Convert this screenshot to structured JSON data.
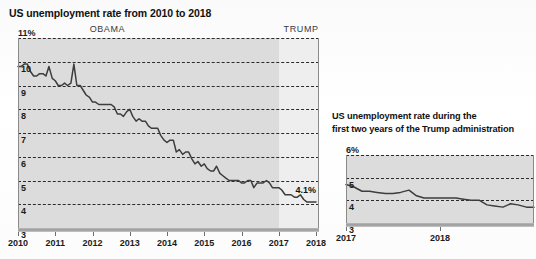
{
  "chart_data": [
    {
      "id": "left",
      "type": "line",
      "title": "US unemployment rate from 2010 to 2018",
      "xlabel": "",
      "ylabel": "",
      "ylim": [
        3,
        11
      ],
      "xlim": [
        2010,
        2018.08
      ],
      "grid": true,
      "y_unit_suffix": "%",
      "ytick_labels": [
        "11%",
        "10",
        "9",
        "8",
        "7",
        "6",
        "5",
        "4",
        "3"
      ],
      "ytick_values": [
        11,
        10,
        9,
        8,
        7,
        6,
        5,
        4,
        3
      ],
      "xtick_labels": [
        "2010",
        "2011",
        "2012",
        "2013",
        "2014",
        "2015",
        "2016",
        "2017",
        "2018"
      ],
      "xtick_values": [
        2010,
        2011,
        2012,
        2013,
        2014,
        2015,
        2016,
        2017,
        2018
      ],
      "era_bands": [
        {
          "label": "OBAMA",
          "start": 2010,
          "end": 2017,
          "shade": "#dcdcdc",
          "label_at": 2012.4
        },
        {
          "label": "TRUMP",
          "start": 2017,
          "end": 2018.08,
          "shade": "#eeeeee",
          "label_at": 2017.6
        }
      ],
      "annotations": [
        {
          "text": "4.1%",
          "x": 2017.45,
          "y": 4.55
        }
      ],
      "x": [
        2010.0,
        2010.08,
        2010.17,
        2010.25,
        2010.33,
        2010.42,
        2010.5,
        2010.58,
        2010.67,
        2010.75,
        2010.83,
        2010.92,
        2011.0,
        2011.08,
        2011.17,
        2011.25,
        2011.33,
        2011.42,
        2011.5,
        2011.58,
        2011.67,
        2011.75,
        2011.83,
        2011.92,
        2012.0,
        2012.08,
        2012.17,
        2012.25,
        2012.33,
        2012.42,
        2012.5,
        2012.58,
        2012.67,
        2012.75,
        2012.83,
        2012.92,
        2013.0,
        2013.08,
        2013.17,
        2013.25,
        2013.33,
        2013.42,
        2013.5,
        2013.58,
        2013.67,
        2013.75,
        2013.83,
        2013.92,
        2014.0,
        2014.08,
        2014.17,
        2014.25,
        2014.33,
        2014.42,
        2014.5,
        2014.58,
        2014.67,
        2014.75,
        2014.83,
        2014.92,
        2015.0,
        2015.08,
        2015.17,
        2015.25,
        2015.33,
        2015.42,
        2015.5,
        2015.58,
        2015.67,
        2015.75,
        2015.83,
        2015.92,
        2016.0,
        2016.08,
        2016.17,
        2016.25,
        2016.33,
        2016.42,
        2016.5,
        2016.58,
        2016.67,
        2016.75,
        2016.83,
        2016.92,
        2017.0,
        2017.08,
        2017.17,
        2017.25,
        2017.33,
        2017.42,
        2017.5,
        2017.58,
        2017.67,
        2017.75,
        2017.83,
        2017.92,
        2018.0
      ],
      "values": [
        9.8,
        9.8,
        9.9,
        9.9,
        9.6,
        9.4,
        9.4,
        9.5,
        9.5,
        9.4,
        9.8,
        9.3,
        9.2,
        9.0,
        9.0,
        9.1,
        9.0,
        9.1,
        9.9,
        9.0,
        9.0,
        8.8,
        8.6,
        8.5,
        8.3,
        8.3,
        8.2,
        8.2,
        8.2,
        8.2,
        8.2,
        8.1,
        7.8,
        7.8,
        7.7,
        7.9,
        8.0,
        7.7,
        7.5,
        7.6,
        7.5,
        7.5,
        7.3,
        7.2,
        7.2,
        7.2,
        6.9,
        6.7,
        6.6,
        6.7,
        6.7,
        6.2,
        6.3,
        6.1,
        6.2,
        6.2,
        5.9,
        5.7,
        5.8,
        5.6,
        5.7,
        5.5,
        5.4,
        5.4,
        5.6,
        5.3,
        5.2,
        5.1,
        5.0,
        5.0,
        5.0,
        5.0,
        4.9,
        4.9,
        5.0,
        5.0,
        4.7,
        4.9,
        4.9,
        4.9,
        5.0,
        4.9,
        4.7,
        4.7,
        4.7,
        4.6,
        4.4,
        4.4,
        4.4,
        4.3,
        4.3,
        4.4,
        4.2,
        4.1,
        4.1,
        4.1,
        4.1
      ]
    },
    {
      "id": "right",
      "type": "line",
      "title": "US unemployment rate during the first two years of the Trump administration",
      "xlabel": "",
      "ylabel": "",
      "ylim": [
        3,
        6
      ],
      "xlim": [
        2017,
        2019.0
      ],
      "grid": true,
      "y_unit_suffix": "%",
      "ytick_labels": [
        "6%",
        "5",
        "4",
        "3"
      ],
      "ytick_values": [
        6,
        5,
        4,
        3
      ],
      "xtick_labels": [
        "2017",
        "2018"
      ],
      "xtick_values": [
        2017,
        2018
      ],
      "era_bands": [
        {
          "label": "",
          "start": 2017,
          "end": 2019.0,
          "shade": "#dcdcdc",
          "label_at": 2018
        }
      ],
      "annotations": [],
      "x": [
        2017.0,
        2017.08,
        2017.17,
        2017.25,
        2017.33,
        2017.42,
        2017.5,
        2017.58,
        2017.67,
        2017.75,
        2017.83,
        2017.92,
        2018.0,
        2018.08,
        2018.17,
        2018.25,
        2018.33,
        2018.42,
        2018.5,
        2018.58,
        2018.67,
        2018.75,
        2018.83,
        2018.92,
        2019.0
      ],
      "values": [
        4.7,
        4.6,
        4.4,
        4.4,
        4.35,
        4.3,
        4.3,
        4.35,
        4.45,
        4.2,
        4.1,
        4.1,
        4.1,
        4.1,
        4.1,
        4.05,
        4.0,
        4.0,
        3.8,
        3.75,
        3.7,
        3.85,
        3.8,
        3.7,
        3.7
      ]
    }
  ],
  "left_panel": {
    "title": "US unemployment rate from 2010 to 2018"
  },
  "right_panel": {
    "title_line1": "US unemployment rate during the",
    "title_line2": "first two years of the Trump administration"
  },
  "colors": {
    "series_line": "#3d3d3d",
    "grid": "#2b2b2b",
    "band_obama": "#dcdcdc",
    "band_trump": "#eeeeee",
    "axis": "#8a8a8a",
    "text": "#1a1a1a"
  }
}
